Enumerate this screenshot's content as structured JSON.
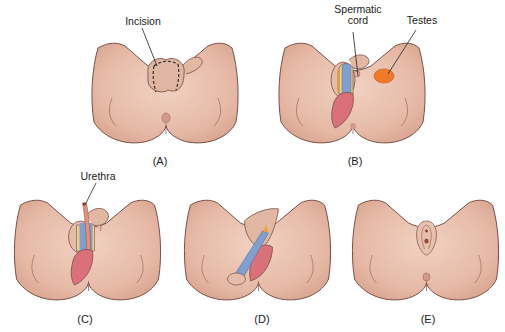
{
  "figure": {
    "panels": [
      {
        "id": "A",
        "caption": "(A)",
        "labels": [
          "Incision"
        ]
      },
      {
        "id": "B",
        "caption": "(B)",
        "labels": [
          "Spermatic cord",
          "Testes"
        ]
      },
      {
        "id": "C",
        "caption": "(C)",
        "labels": [
          "Urethra"
        ]
      },
      {
        "id": "D",
        "caption": "(D)",
        "labels": []
      },
      {
        "id": "E",
        "caption": "(E)",
        "labels": []
      }
    ],
    "label_text": {
      "incision": "Incision",
      "spermatic_line1": "Spermatic",
      "spermatic_line2": "cord",
      "testes": "Testes",
      "urethra": "Urethra"
    },
    "colors": {
      "skin": "#e8c0ae",
      "skin_shadow": "#d7a593",
      "outline": "#7a5048",
      "tissue_red": "#d9707a",
      "vessel_blue": "#7f9fd0",
      "fat_yellow": "#ecd27a",
      "testis_orange": "#f07a2a",
      "text": "#222222"
    }
  }
}
